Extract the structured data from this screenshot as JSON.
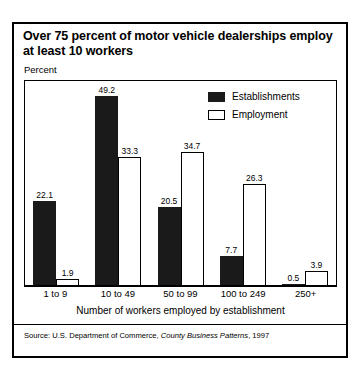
{
  "title": "Over 75 percent of motor vehicle dealerships employ at least 10 workers",
  "axis": {
    "y_label": "Percent",
    "x_title": "Number of workers employed by establishment"
  },
  "legend": {
    "items": [
      {
        "label": "Establishments",
        "swatch": "filled-square-icon",
        "color": "#1a1a1a"
      },
      {
        "label": "Employment",
        "swatch": "hollow-square-icon",
        "color": "#ffffff"
      }
    ]
  },
  "source": {
    "prefix": "Source: U.S. Department of Commerce,",
    "publication": "County Business Patterns",
    "year": ", 1997"
  },
  "chart_data": {
    "type": "bar",
    "title": "Over 75 percent of motor vehicle dealerships employ at least 10 workers",
    "xlabel": "Number of workers employed by establishment",
    "ylabel": "Percent",
    "categories": [
      "1 to 9",
      "10 to 49",
      "50 to 99",
      "100 to 249",
      "250+"
    ],
    "series": [
      {
        "name": "Establishments",
        "color": "#1a1a1a",
        "values": [
          22.1,
          49.2,
          20.5,
          7.7,
          0.5
        ]
      },
      {
        "name": "Employment",
        "color": "#ffffff",
        "values": [
          1.9,
          33.3,
          34.7,
          26.3,
          3.9
        ]
      }
    ],
    "ylim": [
      0,
      53
    ],
    "grid": false,
    "legend_position": "top-right",
    "value_labels": true
  }
}
